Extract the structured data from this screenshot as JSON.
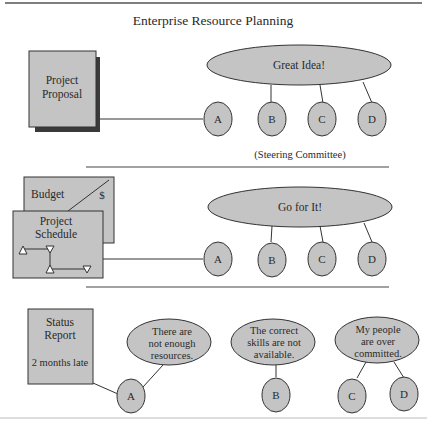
{
  "title": "Enterprise Resource Planning",
  "colors": {
    "fill": "#c4c4c4",
    "stroke": "#333333",
    "shadow": "#3a3a3a",
    "rule": "#444444",
    "bottom_rule": "#bbbbbb"
  },
  "panel1": {
    "doc_label": [
      "Project",
      "Proposal"
    ],
    "ellipse_label": "Great Idea!",
    "nodes": [
      "A",
      "B",
      "C",
      "D"
    ],
    "caption": "(Steering Committee)"
  },
  "panel2": {
    "budget_label": "Budget",
    "budget_symbol": "$",
    "schedule_label": [
      "Project",
      "Schedule"
    ],
    "ellipse_label": "Go for It!",
    "nodes": [
      "A",
      "B",
      "C",
      "D"
    ]
  },
  "panel3": {
    "report_label": [
      "Status",
      "Report"
    ],
    "report_note": "2 months late",
    "bubbles": [
      {
        "lines": [
          "There are",
          "not enough",
          "resources."
        ]
      },
      {
        "lines": [
          "The correct",
          "skills are not",
          "available."
        ]
      },
      {
        "lines": [
          "My people",
          "are over",
          "committed."
        ]
      }
    ],
    "nodes": [
      "A",
      "B",
      "C",
      "D"
    ]
  }
}
